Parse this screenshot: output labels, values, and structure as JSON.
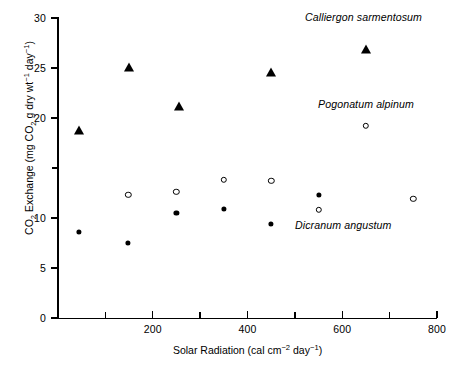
{
  "chart_data": {
    "type": "scatter",
    "title": "",
    "xlabel": "Solar Radiation (cal cm⁻² day⁻¹)",
    "ylabel": "CO₂ Exchange (mg CO₂ g dry wt⁻¹ day⁻¹)",
    "xlim": [
      0,
      800
    ],
    "ylim": [
      0,
      30
    ],
    "xticks": [
      0,
      100,
      200,
      300,
      400,
      500,
      600,
      700,
      800
    ],
    "xticklabels": [
      "",
      "",
      "200",
      "",
      "400",
      "",
      "600",
      "",
      "800"
    ],
    "yticks": [
      0,
      5,
      10,
      15,
      20,
      25,
      30
    ],
    "yticklabels": [
      "0",
      "5",
      "10",
      "15",
      "20",
      "25",
      "30"
    ],
    "ytick_labels_shown": [
      "0",
      "5",
      "10",
      "",
      "20",
      "25",
      "30"
    ],
    "grid": false,
    "legend": "in-plot annotations",
    "series": [
      {
        "name": "Calliergon sarmentosum",
        "marker": "filled-triangle",
        "color": "#000000",
        "points": [
          {
            "x": 44,
            "y": 18.7
          },
          {
            "x": 150,
            "y": 25.0
          },
          {
            "x": 255,
            "y": 21.1
          },
          {
            "x": 450,
            "y": 24.5
          },
          {
            "x": 650,
            "y": 26.8
          }
        ]
      },
      {
        "name": "Pogonatum alpinum",
        "marker": "open-circle",
        "color": "#000000",
        "points": [
          {
            "x": 148,
            "y": 12.3
          },
          {
            "x": 250,
            "y": 12.6
          },
          {
            "x": 350,
            "y": 13.8
          },
          {
            "x": 450,
            "y": 13.7
          },
          {
            "x": 550,
            "y": 10.8
          },
          {
            "x": 650,
            "y": 19.2
          },
          {
            "x": 750,
            "y": 11.9
          }
        ]
      },
      {
        "name": "Dicranum angustum",
        "marker": "filled-circle",
        "color": "#000000",
        "points": [
          {
            "x": 44,
            "y": 8.6
          },
          {
            "x": 148,
            "y": 7.5
          },
          {
            "x": 250,
            "y": 10.5
          },
          {
            "x": 350,
            "y": 10.9
          },
          {
            "x": 450,
            "y": 9.4
          },
          {
            "x": 550,
            "y": 12.3
          }
        ]
      }
    ],
    "annotations": [
      {
        "text": "Calliergon sarmentosum",
        "x_px": 305,
        "y_px": 11
      },
      {
        "text": "Pogonatum alpinum",
        "x_px": 318,
        "y_px": 98
      },
      {
        "text": "Dicranum angustum",
        "x_px": 295,
        "y_px": 219
      }
    ]
  },
  "axis_title_parts": {
    "y_pre": "CO",
    "y_sub1": "2",
    "y_mid1": " Exchange (mg CO",
    "y_sub2": "2",
    "y_mid2": " g dry wt",
    "y_sup1": "−1",
    "y_mid3": " day",
    "y_sup2": "−1",
    "y_end": ")",
    "x_pre": "Solar Radiation (cal cm",
    "x_sup1": "−2",
    "x_mid": " day",
    "x_sup2": "−1",
    "x_end": ")"
  }
}
